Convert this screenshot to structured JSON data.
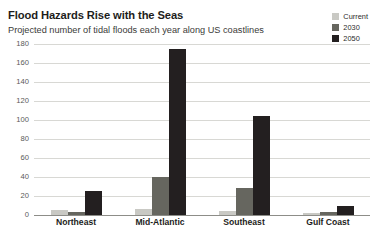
{
  "header": {
    "title": "Flood Hazards Rise with the Seas",
    "subtitle": "Projected number of tidal floods each year along US coastlines"
  },
  "colors": {
    "current": "#c9c9c4",
    "y2030": "#66665f",
    "y2050": "#231f20",
    "gridline": "#d8d8d4",
    "axis": "#8d8d88",
    "title_text": "#1d1d1b",
    "subtitle_text": "#3b3b39",
    "tick_text": "#5a5a56"
  },
  "legend": {
    "position": "top-right",
    "items": [
      {
        "label": "Current",
        "color": "#c9c9c4"
      },
      {
        "label": "2030",
        "color": "#66665f"
      },
      {
        "label": "2050",
        "color": "#231f20"
      }
    ]
  },
  "chart_data": {
    "type": "bar",
    "title": "Flood Hazards Rise with the Seas",
    "subtitle": "Projected number of tidal floods each year along US coastlines",
    "xlabel": "",
    "ylabel": "",
    "categories": [
      "Northeast",
      "Mid-Atlantic",
      "Southeast",
      "Gulf Coast"
    ],
    "series": [
      {
        "name": "Current",
        "color": "#c9c9c4",
        "values": [
          5,
          6,
          4,
          2
        ]
      },
      {
        "name": "2030",
        "color": "#66665f",
        "values": [
          3,
          40,
          28,
          3
        ]
      },
      {
        "name": "2050",
        "color": "#231f20",
        "values": [
          25,
          175,
          104,
          10
        ]
      }
    ],
    "ylim": [
      0,
      180
    ],
    "yticks": [
      0,
      20,
      40,
      60,
      80,
      100,
      120,
      140,
      160,
      180
    ],
    "ytick_labels": [
      "0",
      "20",
      "40",
      "60",
      "80",
      "100",
      "120",
      "140",
      "160",
      "180"
    ],
    "grid": true,
    "grid_axis": "y",
    "legend_position": "top-right"
  }
}
